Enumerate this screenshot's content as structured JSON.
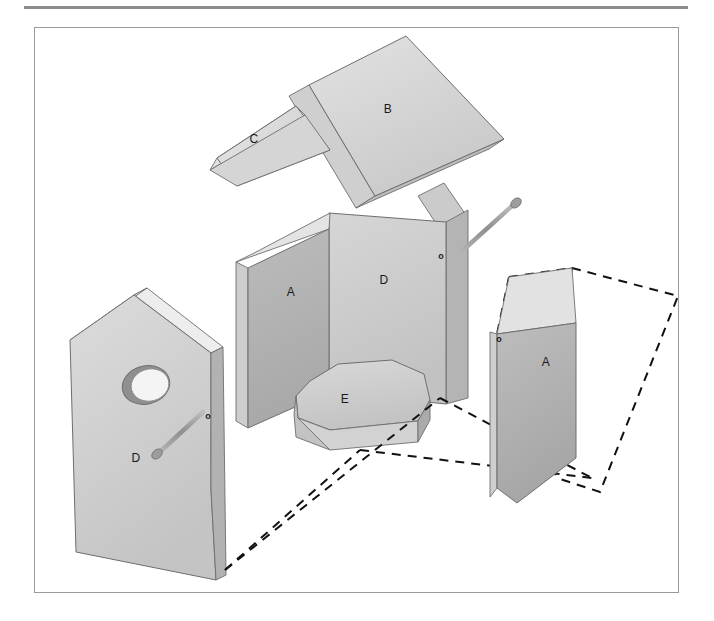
{
  "figure": {
    "kind": "exploded-assembly-diagram",
    "projection": "isometric",
    "background_color": "#ffffff",
    "top_rule": {
      "color": "#8c8c8c",
      "thickness_px": 3
    },
    "frame": {
      "border_color": "#9a9a9a",
      "thickness_px": 1
    }
  },
  "palette": {
    "face_light": "#d9d9d9",
    "face_mid": "#c6c6c6",
    "face_dark": "#b0b0b0",
    "face_darker": "#a2a2a2",
    "edge_highlight": "#efefef",
    "outline": "#6e6e6e",
    "dash_line": "#111111",
    "nail_body": "#9d9d9d",
    "nail_head": "#8a8a8a",
    "hole_inner": "#c0c0c0",
    "hole_shadow": "#8f8f8f",
    "label_text": "#1a1a1a"
  },
  "parts": [
    {
      "id": "roof-main",
      "label": "B",
      "name": "main roof panel",
      "label_x": 388,
      "label_y": 110
    },
    {
      "id": "roof-secondary",
      "label": "C",
      "name": "secondary roof panel",
      "label_x": 254,
      "label_y": 140
    },
    {
      "id": "side-wall-left",
      "label": "A",
      "name": "left side wall",
      "label_x": 291,
      "label_y": 293
    },
    {
      "id": "back-wall",
      "label": "D",
      "name": "back wall",
      "label_x": 384,
      "label_y": 281
    },
    {
      "id": "floor",
      "label": "E",
      "name": "floor panel",
      "label_x": 345,
      "label_y": 400
    },
    {
      "id": "front-wall",
      "label": "D",
      "name": "front wall with entrance hole",
      "label_x": 136,
      "label_y": 459
    },
    {
      "id": "side-wall-right",
      "label": "A",
      "name": "right side wall",
      "label_x": 546,
      "label_y": 363
    }
  ],
  "hole_markers": [
    {
      "id": "hole-marker-back-wall",
      "label": "o",
      "x": 441,
      "y": 257
    },
    {
      "id": "hole-marker-front-wall",
      "label": "o",
      "x": 208,
      "y": 417
    },
    {
      "id": "hole-marker-right-wall",
      "label": "o",
      "x": 499,
      "y": 340
    }
  ],
  "nails": [
    {
      "id": "nail-back-wall",
      "direction": "points down-left toward pilot hole"
    },
    {
      "id": "nail-front-wall",
      "direction": "points up-right toward pilot hole"
    }
  ],
  "entrance_hole": {
    "id": "entrance-hole",
    "name": "bird entrance hole",
    "cx": 146,
    "cy": 385
  },
  "assembly_guides": {
    "id": "assembly-guide-lines",
    "style": "dashed",
    "description": "dashed outlines indicating assembled positions and the swing path of the right side panel"
  }
}
